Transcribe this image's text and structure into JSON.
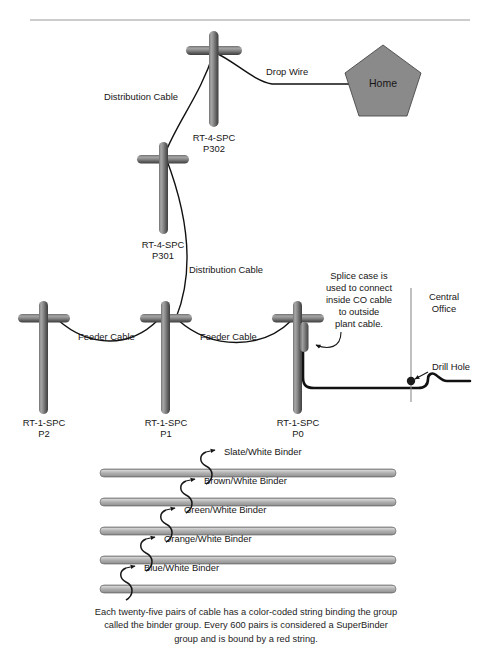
{
  "page": {
    "header_fragment": "",
    "divider": true
  },
  "diagram": {
    "nodes": [
      {
        "id": "P302",
        "type": "utility-pole",
        "label_line1": "RT-4-SPC",
        "label_line2": "P302",
        "x": 212,
        "y": 45
      },
      {
        "id": "P301",
        "type": "utility-pole",
        "label_line1": "RT-4-SPC",
        "label_line2": "P301",
        "x": 161,
        "y": 148
      },
      {
        "id": "P2",
        "type": "utility-pole",
        "label_line1": "RT-1-SPC",
        "label_line2": "P2",
        "x": 43,
        "y": 312
      },
      {
        "id": "P1",
        "type": "utility-pole",
        "label_line1": "RT-1-SPC",
        "label_line2": "P1",
        "x": 164,
        "y": 312
      },
      {
        "id": "P0",
        "type": "utility-pole",
        "label_line1": "RT-1-SPC",
        "label_line2": "P0",
        "x": 297,
        "y": 312
      },
      {
        "id": "home",
        "type": "house-pentagon",
        "label": "Home",
        "x": 383,
        "y": 78
      },
      {
        "id": "co",
        "type": "central-office-wall",
        "label_line1": "Central",
        "label_line2": "Office",
        "x": 413,
        "y": 295
      }
    ],
    "edges": [
      {
        "id": "drop-wire",
        "label": "Drop Wire",
        "from": "P302",
        "to": "home"
      },
      {
        "id": "distribution-cable-upper",
        "label": "Distribution Cable",
        "from": "P301",
        "to": "P302"
      },
      {
        "id": "distribution-cable-lower",
        "label": "Distribution Cable",
        "from": "P1",
        "to": "P301"
      },
      {
        "id": "feeder-cable-left",
        "label": "Feeder Cable",
        "from": "P2",
        "to": "P1"
      },
      {
        "id": "feeder-cable-right",
        "label": "Feeder Cable",
        "from": "P1",
        "to": "P0"
      },
      {
        "id": "co-entrance-cable",
        "label": "",
        "from": "P0",
        "to": "co"
      }
    ],
    "annotations": [
      {
        "id": "splice-case",
        "lines": [
          "Splice case is",
          "used to connect",
          "inside CO cable",
          "to outside",
          "plant cable."
        ]
      },
      {
        "id": "drill-hole",
        "label": "Drill Hole"
      }
    ]
  },
  "binders": {
    "items": [
      {
        "id": "slate",
        "label": "Slate/White Binder",
        "bar_y": 474,
        "hook_x": 206,
        "label_x": 216,
        "label_y": 456
      },
      {
        "id": "brown",
        "label": "Brown/White Binder",
        "bar_y": 503,
        "hook_x": 186,
        "label_x": 196,
        "label_y": 485
      },
      {
        "id": "green",
        "label": "Green/White Binder",
        "bar_y": 532,
        "hook_x": 166,
        "label_x": 176,
        "label_y": 514
      },
      {
        "id": "orange",
        "label": "Orange/White Binder",
        "bar_y": 561,
        "hook_x": 146,
        "label_x": 156,
        "label_y": 543
      },
      {
        "id": "blue",
        "label": "Blue/White Binder",
        "bar_y": 590,
        "hook_x": 126,
        "label_x": 136,
        "label_y": 572
      }
    ],
    "bar_x_start": 100,
    "bar_x_end": 396
  },
  "caption": {
    "line1": "Each twenty-five pairs of cable has a color-coded string binding the group",
    "line2": "called the binder group. Every 600 pairs is considered a SuperBinder",
    "line3": "group and is bound by a red string."
  },
  "colors": {
    "pole_dark": "#4c4c4c",
    "pole_mid": "#8f8f8f",
    "pole_light": "#c9c9c9",
    "cable_line": "#111111",
    "house_fill": "#8a8a8a",
    "binder_fill": "#b4b4b4",
    "text": "#161616",
    "rule": "#9a9a9a"
  }
}
